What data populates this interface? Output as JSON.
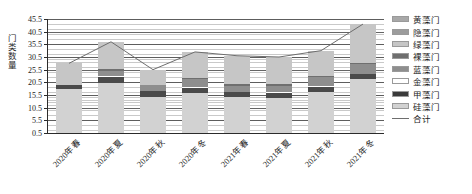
{
  "chart_data": {
    "type": "bar",
    "stacked": true,
    "title": "",
    "xlabel": "",
    "ylabel": "门类数量",
    "ylim": [
      0.5,
      45.5
    ],
    "ytick_step": 5,
    "ytick_labels": [
      "0.5",
      "5.5",
      "10.5",
      "15.5",
      "20.5",
      "25.5",
      "30.5",
      "35.5",
      "40.5",
      "45.5"
    ],
    "ytick_values": [
      0.5,
      5.5,
      10.5,
      15.5,
      20.5,
      25.5,
      30.5,
      35.5,
      40.5,
      45.5
    ],
    "grid": true,
    "legend_position": "right",
    "categories": [
      "2020年春",
      "2020年夏",
      "2020年秋",
      "2020年冬",
      "2021年春",
      "2021年夏",
      "2021年秋",
      "2021年冬"
    ],
    "series": [
      {
        "name": "硅藻门",
        "color": "#d2d2d2",
        "values": [
          17.5,
          20.0,
          14.5,
          16.0,
          14.5,
          14.0,
          16.5,
          21.5
        ]
      },
      {
        "name": "甲藻门",
        "color": "#4a4a4a",
        "values": [
          2.0,
          2.5,
          2.5,
          2.0,
          2.0,
          2.0,
          2.0,
          2.0
        ]
      },
      {
        "name": "金藻门",
        "color": "#ffffff",
        "values": [
          0.0,
          0.5,
          0.0,
          0.5,
          0.0,
          0.5,
          0.5,
          0.0
        ]
      },
      {
        "name": "蓝藻门",
        "color": "#8e8e8e",
        "values": [
          0.0,
          2.0,
          2.5,
          3.0,
          2.5,
          2.5,
          3.5,
          4.0
        ]
      },
      {
        "name": "裸藻门",
        "color": "#6f6f6f",
        "values": [
          0.0,
          0.5,
          0.0,
          0.5,
          0.5,
          0.5,
          0.5,
          0.5
        ]
      },
      {
        "name": "绿藻门",
        "color": "#c6c6c6",
        "values": [
          8.5,
          11.0,
          6.0,
          10.5,
          11.5,
          11.0,
          10.0,
          15.5
        ]
      },
      {
        "name": "隐藻门",
        "color": "#9c9c9c",
        "values": [
          0.0,
          0.0,
          0.0,
          0.0,
          0.0,
          0.0,
          0.0,
          0.0
        ]
      },
      {
        "name": "黄藻门",
        "color": "#a8a8a8",
        "values": [
          0.0,
          0.0,
          0.0,
          0.0,
          0.0,
          0.0,
          0.0,
          0.0
        ]
      }
    ],
    "total_series": {
      "name": "合计",
      "color": "#6e6e6e",
      "values": [
        28.0,
        36.5,
        25.5,
        32.5,
        31.0,
        30.5,
        33.0,
        43.5
      ]
    }
  },
  "legend": {
    "items": [
      {
        "label": "黄藻门",
        "color": "#a8a8a8",
        "type": "swatch"
      },
      {
        "label": "隐藻门",
        "color": "#9c9c9c",
        "type": "swatch"
      },
      {
        "label": "绿藻门",
        "color": "#c6c6c6",
        "type": "swatch"
      },
      {
        "label": "裸藻门",
        "color": "#6f6f6f",
        "type": "swatch"
      },
      {
        "label": "蓝藻门",
        "color": "#8e8e8e",
        "type": "swatch"
      },
      {
        "label": "金藻门",
        "color": "#ffffff",
        "type": "swatch"
      },
      {
        "label": "甲藻门",
        "color": "#3a3a3a",
        "type": "swatch"
      },
      {
        "label": "硅藻门",
        "color": "#d2d2d2",
        "type": "swatch"
      },
      {
        "label": "合计",
        "color": "#6e6e6e",
        "type": "line"
      }
    ]
  },
  "axis": {
    "y_title": "门类数量"
  }
}
